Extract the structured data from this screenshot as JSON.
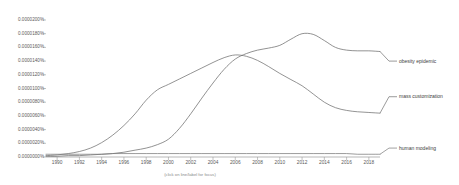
{
  "caption": "(click on line/label for focus)",
  "chart_data": {
    "type": "line",
    "title": "",
    "xlabel": "",
    "ylabel": "",
    "grid": false,
    "legend_position": "right-inline",
    "xlim": [
      1989,
      2019
    ],
    "ylim": [
      0.0,
      2e-05
    ],
    "x_tick_labels": [
      "1990",
      "1992",
      "1994",
      "1996",
      "1998",
      "2000",
      "2002",
      "2004",
      "2006",
      "2008",
      "2010",
      "2012",
      "2014",
      "2016",
      "2018"
    ],
    "x_tick_values": [
      1990,
      1992,
      1994,
      1996,
      1998,
      2000,
      2002,
      2004,
      2006,
      2008,
      2010,
      2012,
      2014,
      2016,
      2018
    ],
    "y_tick_labels": [
      "0.0000200%",
      "0.0000180%",
      "0.0000160%",
      "0.0000140%",
      "0.0000120%",
      "0.0000100%",
      "0.0000080%",
      "0.0000060%",
      "0.0000040%",
      "0.0000020%",
      "0.0000000%"
    ],
    "y_tick_values": [
      2e-05,
      1.8e-05,
      1.6e-05,
      1.4e-05,
      1.2e-05,
      1e-05,
      8e-06,
      6e-06,
      4e-06,
      2e-06,
      0.0
    ],
    "x": [
      1989,
      1990,
      1991,
      1992,
      1993,
      1994,
      1995,
      1996,
      1997,
      1998,
      1999,
      2000,
      2001,
      2002,
      2003,
      2004,
      2005,
      2006,
      2007,
      2008,
      2009,
      2010,
      2011,
      2012,
      2013,
      2014,
      2015,
      2016,
      2017,
      2018,
      2019
    ],
    "series": [
      {
        "name": "obesity epidemic",
        "color": "#6e6e6e",
        "values": [
          1e-07,
          1e-07,
          2e-07,
          2e-07,
          3e-07,
          4e-07,
          5e-07,
          7e-07,
          1e-06,
          1.3e-06,
          1.8e-06,
          2.6e-06,
          4.2e-06,
          6.3e-06,
          8.6e-06,
          1.08e-05,
          1.28e-05,
          1.43e-05,
          1.51e-05,
          1.56e-05,
          1.59e-05,
          1.63e-05,
          1.72e-05,
          1.8e-05,
          1.79e-05,
          1.7e-05,
          1.6e-05,
          1.56e-05,
          1.55e-05,
          1.55e-05,
          1.54e-05
        ],
        "label_y_value": 1.4e-05
      },
      {
        "name": "mass customization",
        "color": "#707070",
        "values": [
          2e-07,
          3e-07,
          5e-07,
          8e-07,
          1.3e-06,
          2.1e-06,
          3.2e-06,
          4.6e-06,
          6.3e-06,
          8.3e-06,
          9.8e-06,
          1.06e-05,
          1.14e-05,
          1.22e-05,
          1.3e-05,
          1.38e-05,
          1.45e-05,
          1.49e-05,
          1.47e-05,
          1.41e-05,
          1.32e-05,
          1.22e-05,
          1.13e-05,
          1.04e-05,
          9.2e-06,
          8e-06,
          7.2e-06,
          6.8e-06,
          6.6e-06,
          6.5e-06,
          6.4e-06
        ],
        "label_y_value": 8.8e-06
      },
      {
        "name": "human modeling",
        "color": "#7a7a7a",
        "values": [
          4e-07,
          4e-07,
          4e-07,
          4e-07,
          4e-07,
          4e-07,
          5e-07,
          5e-07,
          5e-07,
          5e-07,
          5e-07,
          5e-07,
          5e-07,
          5e-07,
          5e-07,
          5e-07,
          5e-07,
          5e-07,
          5e-07,
          5e-07,
          5e-07,
          5e-07,
          5e-07,
          5e-07,
          5e-07,
          5e-07,
          5e-07,
          5e-07,
          4e-07,
          4e-07,
          4e-07
        ],
        "label_y_value": 1.3e-06
      }
    ],
    "axis_color": "#999999",
    "tick_color": "#9a9a9a",
    "background": "#ffffff"
  }
}
